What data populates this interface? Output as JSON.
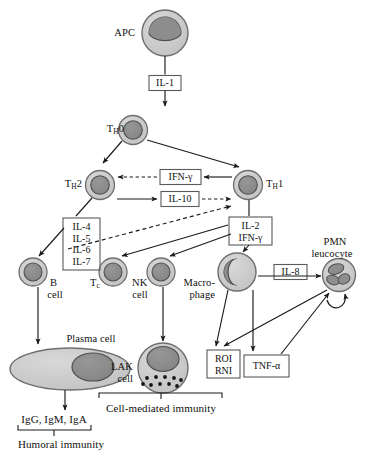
{
  "diagram": {
    "colors": {
      "cytoplasm_fill": "#c9c9c9",
      "cytoplasm_stroke": "#6e6e6e",
      "nucleus_fill": "#8d8d8d",
      "nucleus_stroke": "#4f4f4f",
      "granule_fill": "#161616",
      "box_stroke": "#5a5a5a",
      "line_stroke": "#1a1a1a",
      "text": "#111111",
      "background": "#ffffff"
    },
    "cells": [
      {
        "id": "apc",
        "label": "APC",
        "label_html": "APC",
        "x": 165,
        "y": 33,
        "r": 23,
        "nucleus": "crescent-top"
      },
      {
        "id": "th0",
        "label": "TH0",
        "label_html": "T<sub>H</sub>0",
        "x": 133,
        "y": 130,
        "r": 14.5,
        "nucleus": "round"
      },
      {
        "id": "th2",
        "label": "TH2",
        "label_html": "T<sub>H</sub>2",
        "x": 100,
        "y": 185,
        "r": 14.5,
        "nucleus": "round"
      },
      {
        "id": "th1",
        "label": "TH1",
        "label_html": "T<sub>H</sub>1",
        "x": 248,
        "y": 185,
        "r": 14.5,
        "nucleus": "round"
      },
      {
        "id": "bcell",
        "label": "B cell",
        "label_html": "B<br>cell",
        "x": 33,
        "y": 272,
        "r": 14,
        "nucleus": "round"
      },
      {
        "id": "tccell",
        "label": "Tc cell",
        "label_html": "T<sub>c</sub>",
        "x": 113,
        "y": 272,
        "r": 14,
        "nucleus": "round"
      },
      {
        "id": "nkcell",
        "label": "NK cell",
        "label_html": "NK<br>cell",
        "x": 161,
        "y": 272,
        "r": 14,
        "nucleus": "round"
      },
      {
        "id": "macrophage",
        "label": "Macrophage",
        "label_html": "Macro-<br>phage",
        "x": 237,
        "y": 272,
        "r": 19,
        "nucleus": "crescent-right"
      },
      {
        "id": "pmn",
        "label": "PMN leucocyte",
        "label_html": "PMN<br>leucocyte",
        "x": 339,
        "y": 275,
        "r": 17,
        "nucleus": "lobed"
      },
      {
        "id": "plasma",
        "label": "Plasma cell",
        "label_html": "Plasma cell",
        "x": 70,
        "y": 369,
        "rx": 60,
        "ry": 21,
        "nucleus": "oval-offset"
      },
      {
        "id": "lak",
        "label": "LAK cell",
        "label_html": "LAK<br>cell",
        "x": 163,
        "y": 368,
        "r": 26,
        "nucleus": "round-top-granules"
      }
    ],
    "cell_labels": {
      "apc": "APC",
      "th0": "Tₕ0",
      "th2": "Tₕ2",
      "th1": "Tₕ1",
      "b_cell_line1": "B",
      "b_cell_line2": "cell",
      "tc_cell": "Tᴄ",
      "nk_cell_line1": "NK",
      "nk_cell_line2": "cell",
      "macrophage_line1": "Macro-",
      "macrophage_line2": "phage",
      "pmn_line1": "PMN",
      "pmn_line2": "leucocyte",
      "plasma_cell": "Plasma cell",
      "lak_line1": "LAK",
      "lak_line2": "cell"
    },
    "boxes": [
      {
        "id": "il1",
        "lines": [
          "IL-1"
        ],
        "x": 165,
        "y": 83,
        "w": 32,
        "h": 15
      },
      {
        "id": "ifng",
        "lines": [
          "IFN-γ"
        ],
        "x": 180,
        "y": 177,
        "w": 40,
        "h": 15
      },
      {
        "id": "il10",
        "lines": [
          "IL-10"
        ],
        "x": 180,
        "y": 199,
        "w": 38,
        "h": 15
      },
      {
        "id": "il4567",
        "lines": [
          "IL-4",
          "IL-5",
          "IL-6",
          "IL-7"
        ],
        "x": 81,
        "y": 244,
        "w": 36,
        "h": 52
      },
      {
        "id": "il2ifng",
        "lines": [
          "IL-2",
          "IFN-γ"
        ],
        "x": 250,
        "y": 231,
        "w": 42,
        "h": 28
      },
      {
        "id": "il8",
        "lines": [
          "IL-8"
        ],
        "x": 290,
        "y": 272,
        "w": 32,
        "h": 15
      },
      {
        "id": "roirni",
        "lines": [
          "ROI",
          "RNI"
        ],
        "x": 223,
        "y": 364,
        "w": 32,
        "h": 28
      },
      {
        "id": "tnfa",
        "lines": [
          "TNF-α"
        ],
        "x": 266,
        "y": 368,
        "w": 44,
        "h": 18
      }
    ],
    "box_text": {
      "il1": "IL-1",
      "ifng": "IFN-γ",
      "il10": "IL-10",
      "il4": "IL-4",
      "il5": "IL-5",
      "il6": "IL-6",
      "il7": "IL-7",
      "il2": "IL-2",
      "il2_ifng": "IFN-γ",
      "il8": "IL-8",
      "roi": "ROI",
      "rni": "RNI",
      "tnfa": "TNF-α"
    },
    "outcomes": {
      "antibodies": "IgG, IgM, IgA",
      "humoral": "Humoral immunity",
      "cell_mediated": "Cell-mediated immunity"
    },
    "arrows": [
      {
        "from": "apc",
        "to": "il1",
        "style": "solid"
      },
      {
        "from": "il1",
        "to": "th0",
        "style": "solid"
      },
      {
        "from": "th0",
        "to": "th2",
        "style": "solid"
      },
      {
        "from": "th0",
        "to": "th1",
        "style": "solid"
      },
      {
        "from": "th1",
        "to": "ifng",
        "style": "solid"
      },
      {
        "from": "ifng",
        "to": "th2",
        "style": "dashed",
        "meaning": "inhibition"
      },
      {
        "from": "th2",
        "to": "il10",
        "style": "solid"
      },
      {
        "from": "il10",
        "to": "th1",
        "style": "dashed",
        "meaning": "inhibition"
      },
      {
        "from": "th2",
        "to": "il4567",
        "style": "solid"
      },
      {
        "from": "il4567",
        "to": "bcell",
        "style": "solid"
      },
      {
        "from": "il4567",
        "to": "th1",
        "style": "dashed",
        "meaning": "inhibition"
      },
      {
        "from": "th1",
        "to": "il2ifng",
        "style": "solid"
      },
      {
        "from": "il2ifng",
        "to": "tccell",
        "style": "solid"
      },
      {
        "from": "il2ifng",
        "to": "nkcell",
        "style": "solid"
      },
      {
        "from": "il2ifng",
        "to": "macrophage",
        "style": "solid"
      },
      {
        "from": "macrophage",
        "to": "pmn",
        "style": "solid",
        "via": "il8"
      },
      {
        "from": "bcell",
        "to": "plasma",
        "style": "solid"
      },
      {
        "from": "nkcell",
        "to": "lak",
        "style": "solid"
      },
      {
        "from": "plasma",
        "to": "antibodies",
        "style": "solid"
      },
      {
        "from": "macrophage",
        "to": "roirni",
        "style": "solid"
      },
      {
        "from": "macrophage",
        "to": "tnfa",
        "style": "solid"
      },
      {
        "from": "pmn",
        "to": "roirni",
        "style": "solid"
      },
      {
        "from": "tnfa",
        "to": "pmn",
        "style": "solid"
      },
      {
        "from": "pmn",
        "to": "pmn",
        "style": "solid",
        "meaning": "autocrine"
      }
    ]
  }
}
